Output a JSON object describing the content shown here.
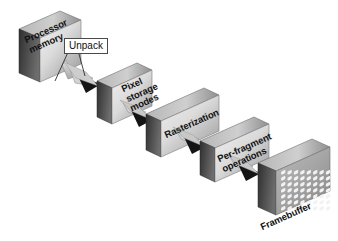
{
  "figure": {
    "background_color": "#ffffff",
    "width": 338,
    "height": 242
  },
  "palette": {
    "slab_face_light": "#e8e8e8",
    "slab_face_dark": "#9a9a9a",
    "slab_top_light": "#d2d2d2",
    "slab_top_dark": "#8c8c8c",
    "slab_side_dark": "#3a3a3a",
    "slab_side_light": "#777777",
    "arrow_fill": "#d0d0d0",
    "arrow_head": "#111111",
    "arrow_stroke": "#6a6a6a",
    "text_color": "#111111",
    "callout_border": "#4a4a4a",
    "framebuffer_cell": "#f4f4f4",
    "bottom_rule": "#d9d9d9"
  },
  "stages": [
    {
      "id": "processor-memory",
      "label": "Processor\nmemory",
      "line1": "Processor",
      "line2": "memory",
      "order": 1
    },
    {
      "id": "pixel-storage-modes",
      "label": "Pixel\nstorage\nmodes",
      "line1": "Pixel",
      "line2": "storage",
      "line3": "modes",
      "order": 2
    },
    {
      "id": "rasterization",
      "label": "Rasterization",
      "line1": "Rasterization",
      "order": 3
    },
    {
      "id": "per-fragment-operations",
      "label": "Per-fragment\noperations",
      "line1": "Per-fragment",
      "line2": "operations",
      "order": 4
    },
    {
      "id": "framebuffer",
      "label": "Framebuffer",
      "line1": "Framebuffer",
      "order": 5
    }
  ],
  "callouts": [
    {
      "id": "unpack",
      "label": "Unpack",
      "attached_to": "arrow-processor-to-pixel"
    }
  ],
  "arrows": [
    {
      "id": "arrow-processor-to-pixel",
      "from": "processor-memory",
      "to": "pixel-storage-modes"
    },
    {
      "id": "arrow-pixel-to-rasterization",
      "from": "pixel-storage-modes",
      "to": "rasterization"
    },
    {
      "id": "arrow-rasterization-to-perfragment",
      "from": "rasterization",
      "to": "per-fragment-operations"
    },
    {
      "id": "arrow-perfragment-to-framebuffer",
      "from": "per-fragment-operations",
      "to": "framebuffer"
    }
  ],
  "framebuffer_grid": {
    "columns": 8,
    "rows": 7,
    "cell_color": "#f4f4f4"
  }
}
